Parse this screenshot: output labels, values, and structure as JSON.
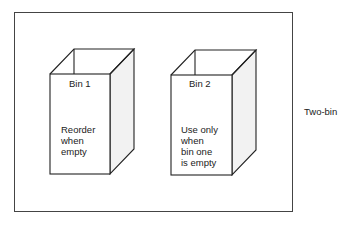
{
  "diagram": {
    "side_label": "Two-bin",
    "bins": [
      {
        "title": "Bin 1",
        "text_lines": [
          "Reorder",
          "when",
          "empty"
        ]
      },
      {
        "title": "Bin 2",
        "text_lines": [
          "Use only",
          "when",
          "bin one",
          "is empty"
        ]
      }
    ]
  }
}
